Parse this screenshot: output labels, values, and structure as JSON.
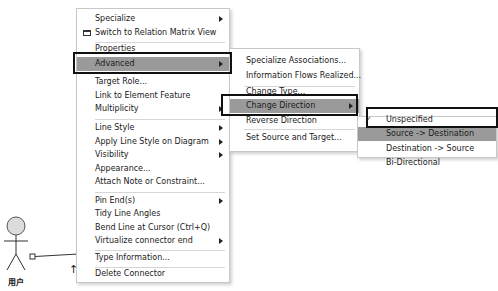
{
  "diagram": {
    "actor_label": "用户",
    "arrow_glyph": "↑"
  },
  "context_menu": {
    "items": [
      {
        "label": "Specialize",
        "submenu": true
      },
      {
        "label": "Switch to Relation Matrix View",
        "icon": "matrix-view-icon"
      },
      {
        "label": "Properties"
      },
      {
        "label": "Advanced",
        "submenu": true,
        "highlighted": true
      },
      {
        "label": "Target Role..."
      },
      {
        "label": "Link to Element Feature"
      },
      {
        "label": "Multiplicity",
        "submenu": true
      },
      {
        "label": "Line Style",
        "submenu": true
      },
      {
        "label": "Apply Line Style on Diagram",
        "submenu": true
      },
      {
        "label": "Visibility",
        "submenu": true
      },
      {
        "label": "Appearance..."
      },
      {
        "label": "Attach Note or Constraint..."
      },
      {
        "label": "Pin End(s)",
        "submenu": true
      },
      {
        "label": "Tidy Line Angles"
      },
      {
        "label": "Bend Line at Cursor (Ctrl+Q)"
      },
      {
        "label": "Virtualize connector end",
        "submenu": true
      },
      {
        "label": "Type Information..."
      },
      {
        "label": "Delete Connector"
      }
    ]
  },
  "advanced_submenu": {
    "items": [
      {
        "label": "Specialize Associations..."
      },
      {
        "label": "Information Flows Realized..."
      },
      {
        "label": "Change Type..."
      },
      {
        "label": "Change Direction",
        "submenu": true,
        "highlighted": true
      },
      {
        "label": "Reverse Direction"
      },
      {
        "label": "Set Source and Target..."
      }
    ]
  },
  "direction_submenu": {
    "check_glyph": "✓",
    "items": [
      {
        "label": "Unspecified",
        "checked": true
      },
      {
        "label": "Source -> Destination",
        "highlighted": true
      },
      {
        "label": "Destination -> Source"
      },
      {
        "label": "Bi-Directional"
      }
    ]
  },
  "colors": {
    "highlight": "#9a9a9a",
    "callout_border": "#111111",
    "menu_border": "#c8c8c8"
  }
}
